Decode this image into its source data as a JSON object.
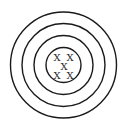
{
  "diagram": {
    "center": {
      "x": 63.5,
      "y": 65
    },
    "rings": [
      {
        "r": 53
      },
      {
        "r": 41.5
      },
      {
        "r": 29.5
      },
      {
        "r": 17.5
      }
    ],
    "marks": [
      {
        "label": "X",
        "x": 57,
        "y": 57
      },
      {
        "label": "X",
        "x": 70,
        "y": 57
      },
      {
        "label": "X",
        "x": 64,
        "y": 66
      },
      {
        "label": "X",
        "x": 57,
        "y": 75
      },
      {
        "label": "X",
        "x": 70,
        "y": 75
      }
    ],
    "stroke_color": "#1a1a1a"
  }
}
